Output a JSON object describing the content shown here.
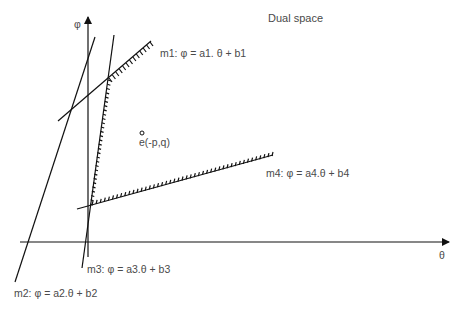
{
  "title": "Dual space",
  "axes": {
    "x_label": "θ",
    "y_label": "φ"
  },
  "lines": [
    {
      "id": "m1",
      "label": "m1: φ = a1. θ + b1",
      "hatched": true
    },
    {
      "id": "m2",
      "label": "m2: φ = a2.θ + b2",
      "hatched": false
    },
    {
      "id": "m3",
      "label": "m3: φ = a3.θ + b3",
      "hatched": true
    },
    {
      "id": "m4",
      "label": "m4: φ = a4.θ + b4",
      "hatched": true
    }
  ],
  "point": {
    "label": "e(-p,q)"
  },
  "colors": {
    "stroke": "#111111",
    "text": "#4a4a4a"
  }
}
